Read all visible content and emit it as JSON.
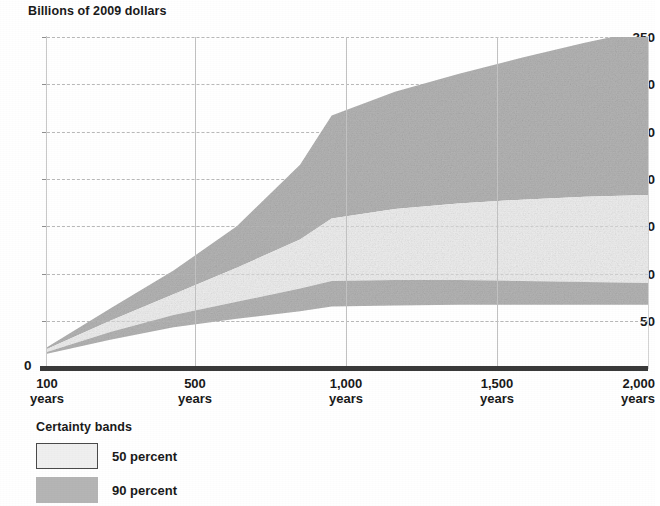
{
  "chart_data": {
    "type": "area",
    "title": "Billions of 2009 dollars",
    "ylabel": "Billions of 2009 dollars",
    "xlabel": "",
    "ylim": [
      0,
      350
    ],
    "yticks": [
      0,
      50,
      100,
      150,
      200,
      250,
      300,
      350
    ],
    "ytick_labels": [
      "0",
      "50",
      "100",
      "150",
      "200",
      "250",
      "300",
      "350"
    ],
    "xlim": [
      100,
      2000
    ],
    "xticks": [
      100,
      500,
      1000,
      1500,
      2000
    ],
    "xtick_labels": [
      "100\nyears",
      "500\nyears",
      "1,000\nyears",
      "1,500\nyears",
      "2,000\nyears"
    ],
    "xtick_lines": [
      {
        "value": "100",
        "unit": "years"
      },
      {
        "value": "500",
        "unit": "years"
      },
      {
        "value": "1,000",
        "unit": "years"
      },
      {
        "value": "1,500",
        "unit": "years"
      },
      {
        "value": "2,000",
        "unit": "years"
      }
    ],
    "grid": {
      "horizontal": "dashed",
      "vertical": "solid"
    },
    "legend": {
      "position": "below-left",
      "title": "Certainty bands",
      "entries": [
        {
          "label": "50 percent",
          "fill": "#efefef",
          "stroke": "#4a4a4a"
        },
        {
          "label": "90 percent",
          "fill": "#b5b5b5",
          "stroke": "none"
        }
      ]
    },
    "x": [
      100,
      300,
      500,
      700,
      900,
      1000,
      1200,
      1400,
      1600,
      1800,
      2000
    ],
    "series": [
      {
        "name": "90 percent upper",
        "values": [
          22,
          63,
          103,
          150,
          215,
          267,
          292,
          311,
          328,
          344,
          358
        ]
      },
      {
        "name": "50 percent upper",
        "values": [
          20,
          50,
          78,
          106,
          136,
          158,
          168,
          174,
          178,
          181,
          183
        ]
      },
      {
        "name": "50 percent lower",
        "values": [
          17,
          38,
          56,
          70,
          84,
          92,
          93,
          93,
          92,
          91,
          90
        ]
      },
      {
        "name": "90 percent lower",
        "values": [
          15,
          30,
          43,
          52,
          60,
          65,
          66,
          67,
          67,
          67,
          67
        ]
      }
    ],
    "colors": {
      "band_90": "#b5b5b5",
      "band_50": "#efefef",
      "axis": "#3a3a3a",
      "grid": "#b9b9b9"
    }
  },
  "legend": {
    "title": "Certainty bands",
    "item_50": "50 percent",
    "item_90": "90 percent"
  },
  "axis": {
    "y_title": "Billions of 2009 dollars",
    "zero": "0"
  }
}
